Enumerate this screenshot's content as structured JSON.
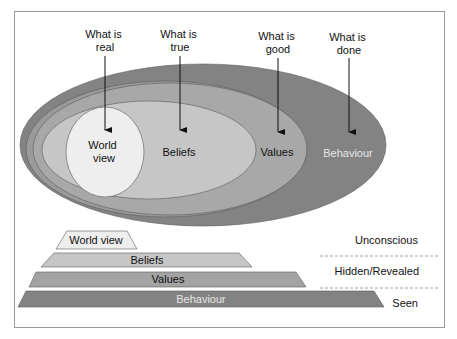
{
  "colors": {
    "frame": "#9a9a9a",
    "behaviour": "#838383",
    "values": "#a3a3a3",
    "beliefs": "#c2c2c2",
    "worldview": "#eeeeee",
    "stroke": "#5a5a5a",
    "arrow": "#111111"
  },
  "top_labels": [
    {
      "line1": "What is",
      "line2": "real"
    },
    {
      "line1": "What is",
      "line2": "true"
    },
    {
      "line1": "What is",
      "line2": "good"
    },
    {
      "line1": "What is",
      "line2": "done"
    }
  ],
  "ellipse_labels": {
    "worldview_line1": "World",
    "worldview_line2": "view",
    "beliefs": "Beliefs",
    "values": "Values",
    "behaviour": "Behaviour"
  },
  "layers": [
    {
      "label": "World view"
    },
    {
      "label": "Beliefs"
    },
    {
      "label": "Values"
    },
    {
      "label": "Behaviour"
    }
  ],
  "levels": [
    {
      "label": "Unconscious"
    },
    {
      "label": "Hidden/Revealed"
    },
    {
      "label": "Seen"
    }
  ]
}
